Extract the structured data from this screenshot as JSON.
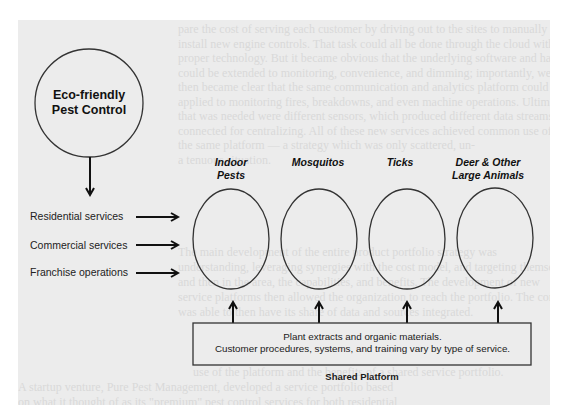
{
  "hub": {
    "title_line1": "Eco-friendly",
    "title_line2": "Pest Control"
  },
  "services": [
    {
      "label": "Residential services"
    },
    {
      "label": "Commercial services"
    },
    {
      "label": "Franchise operations"
    }
  ],
  "categories": [
    {
      "line1": "Indoor",
      "line2": "Pests"
    },
    {
      "line1": "Mosquitos",
      "line2": ""
    },
    {
      "line1": "Ticks",
      "line2": ""
    },
    {
      "line1": "Deer & Other",
      "line2": "Large Animals"
    }
  ],
  "platform": {
    "line1": "Plant extracts and organic materials.",
    "line2": "Customer procedures, systems, and training vary by type of service.",
    "caption": "Shared Platform"
  },
  "background_text": {
    "lines_top": [
      "pare the cost of serving each customer by driving out to the sites to manually",
      "install new engine controls. That task could all be done through the cloud with",
      "proper technology. But it became obvious that the underlying software and hard-",
      "could be extended to monitoring, convenience, and dimming; importantly, we also",
      "then became clear that the same communication and analytics platform could be",
      "applied to monitoring fires, breakdowns, and even machine operations. Ultimately,",
      "that was needed were different sensors, which produced different data streams",
      "connected for centralizing. All of these new services achieved common use of",
      "the same platform — a strategy which was only scattered, un-",
      "a tenuous situation."
    ],
    "lines_mid": [
      "The main development of the entire product portfolio strategy was",
      "understanding, leveraging synergies with the cost model, and targeting themselves",
      "and then in the area, the capabilities, and benefits. The development of new",
      "service platforms then allowed the organization to reach the portfolio. The company",
      "was able to then have its share of data and sources integrated."
    ],
    "lines_bottom": [
      "use of the platform and the benefits of a shared service portfolio.",
      "A startup venture, Pure Pest Management, developed a service portfolio based",
      "on what it thought of as its \"premium\" pest control services for both residential"
    ]
  }
}
